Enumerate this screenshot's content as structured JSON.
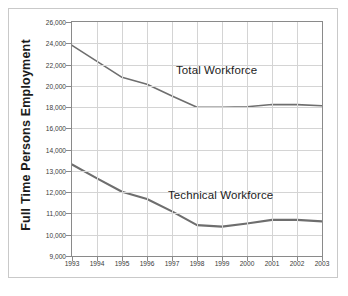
{
  "axis_title_y": "Full Time Persons Employment",
  "annotations": {
    "total": "Total Workforce",
    "technical": "Technical Workforce"
  },
  "colors": {
    "line": "#6e6e6e",
    "grid": "#d4d4d4",
    "axis": "#8a8a8a",
    "text": "#1c1c1c",
    "background": "#ffffff"
  },
  "chart_data": {
    "type": "line",
    "title": "",
    "xlabel": "",
    "ylabel": "Full Time Persons Employment",
    "x": [
      1993,
      1994,
      1995,
      1996,
      1997,
      1998,
      1999,
      2000,
      2001,
      2002,
      2003
    ],
    "xtick_labels": [
      "1993",
      "1994",
      "1995",
      "1996",
      "1997",
      "1998",
      "1999",
      "2000",
      "2001",
      "2002",
      "2003"
    ],
    "ytick_labels": [
      "26,000",
      "24,000",
      "22,000",
      "20,000",
      "18,000",
      "16,000",
      "14,000",
      "13,000",
      "12,000",
      "11,000",
      "10,000",
      "9,000"
    ],
    "ytick_values": [
      26000,
      24000,
      22000,
      20000,
      18000,
      16000,
      14000,
      13000,
      12000,
      11000,
      10000,
      9000
    ],
    "y_axis_note": "broken scale: 26,000-14,000 in 2,000 steps, 14,000-9,000 in 1,000 steps, evenly spaced",
    "ylim": [
      9000,
      26000
    ],
    "grid": true,
    "legend": "inline annotations",
    "series": [
      {
        "name": "Total Workforce",
        "values": [
          23800,
          22300,
          20800,
          20150,
          19050,
          17980,
          17980,
          18030,
          18250,
          18230,
          18130
        ]
      },
      {
        "name": "Technical Workforce",
        "values": [
          13300,
          12650,
          12020,
          11680,
          11100,
          10450,
          10380,
          10530,
          10700,
          10700,
          10630
        ]
      }
    ]
  }
}
